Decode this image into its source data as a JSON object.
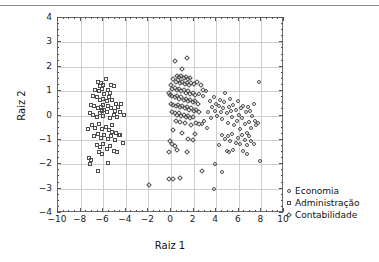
{
  "chart_data": {
    "type": "scatter",
    "title": "",
    "xlabel": "Raiz 1",
    "ylabel": "Raiz 2",
    "xlim": [
      -10,
      10
    ],
    "ylim": [
      -4,
      4
    ],
    "xticks": [
      -10,
      -8,
      -6,
      -4,
      -2,
      0,
      2,
      4,
      6,
      8,
      10
    ],
    "xticklabels": [
      "−10",
      "−8",
      "−6",
      "−4",
      "−2",
      "0",
      "2",
      "4",
      "6",
      "8",
      "10"
    ],
    "yticks": [
      -4,
      -3,
      -2,
      -1,
      0,
      1,
      2,
      3,
      4
    ],
    "yticklabels": [
      "−4",
      "−3",
      "−2",
      "−1",
      "0",
      "1",
      "2",
      "3",
      "4"
    ],
    "grid": true,
    "legend_position": "right",
    "series": [
      {
        "name": "Economia",
        "marker": "circle",
        "color": "#4c4c4c",
        "points": [
          [
            2.6,
            0.85
          ],
          [
            2.9,
            0.75
          ],
          [
            3.2,
            0.95
          ],
          [
            3.5,
            0.55
          ],
          [
            3.7,
            0.3
          ],
          [
            3.9,
            0.7
          ],
          [
            4.0,
            0.15
          ],
          [
            4.1,
            0.45
          ],
          [
            4.2,
            -0.05
          ],
          [
            4.3,
            0.35
          ],
          [
            4.4,
            0.6
          ],
          [
            4.5,
            0.1
          ],
          [
            4.6,
            -0.2
          ],
          [
            4.7,
            0.25
          ],
          [
            4.8,
            0.5
          ],
          [
            4.9,
            0.9
          ],
          [
            5.0,
            0.05
          ],
          [
            5.1,
            -0.35
          ],
          [
            5.2,
            0.3
          ],
          [
            5.3,
            0.65
          ],
          [
            5.4,
            0.15
          ],
          [
            5.5,
            -0.1
          ],
          [
            5.6,
            0.4
          ],
          [
            5.7,
            -0.45
          ],
          [
            5.8,
            0.2
          ],
          [
            5.9,
            -0.25
          ],
          [
            6.0,
            0.55
          ],
          [
            6.1,
            0.0
          ],
          [
            6.2,
            -0.6
          ],
          [
            6.3,
            0.25
          ],
          [
            6.4,
            -0.15
          ],
          [
            6.5,
            0.35
          ],
          [
            6.6,
            -0.4
          ],
          [
            6.7,
            0.1
          ],
          [
            6.8,
            -0.75
          ],
          [
            6.9,
            0.3
          ],
          [
            7.0,
            -0.3
          ],
          [
            7.1,
            0.15
          ],
          [
            7.2,
            -0.55
          ],
          [
            7.3,
            -0.05
          ],
          [
            7.4,
            0.45
          ],
          [
            7.5,
            -0.25
          ],
          [
            7.6,
            -0.45
          ],
          [
            7.8,
            -0.35
          ],
          [
            7.9,
            1.35
          ],
          [
            8.0,
            -1.9
          ],
          [
            4.6,
            -0.85
          ],
          [
            4.9,
            -1.0
          ],
          [
            5.1,
            -0.9
          ],
          [
            5.3,
            -1.1
          ],
          [
            5.5,
            -0.8
          ],
          [
            5.8,
            -1.15
          ],
          [
            6.0,
            -0.95
          ],
          [
            6.2,
            -1.2
          ],
          [
            6.4,
            -0.85
          ],
          [
            6.6,
            -1.05
          ],
          [
            6.8,
            -1.25
          ],
          [
            7.0,
            -0.9
          ],
          [
            7.2,
            -1.1
          ],
          [
            7.4,
            -1.2
          ],
          [
            5.0,
            -1.5
          ],
          [
            5.2,
            -1.55
          ],
          [
            5.6,
            -1.45
          ],
          [
            6.5,
            -1.5
          ],
          [
            6.8,
            -1.6
          ],
          [
            4.3,
            -1.25
          ],
          [
            4.0,
            -2.05
          ],
          [
            4.6,
            -2.35
          ],
          [
            3.9,
            -3.05
          ],
          [
            3.3,
            -0.55
          ],
          [
            3.0,
            -0.25
          ],
          [
            2.8,
            -0.4
          ],
          [
            3.6,
            -0.15
          ],
          [
            3.4,
            0.1
          ]
        ]
      },
      {
        "name": "Administração",
        "marker": "square",
        "color": "#4c4c4c",
        "points": [
          [
            -6.4,
            1.35
          ],
          [
            -6.1,
            1.3
          ],
          [
            -5.7,
            1.45
          ],
          [
            -5.2,
            1.2
          ],
          [
            -5.0,
            1.15
          ],
          [
            -6.6,
            1.0
          ],
          [
            -6.3,
            0.95
          ],
          [
            -6.0,
            1.05
          ],
          [
            -5.8,
            0.85
          ],
          [
            -5.5,
            1.0
          ],
          [
            -5.3,
            0.9
          ],
          [
            -6.8,
            0.75
          ],
          [
            -6.5,
            0.7
          ],
          [
            -6.2,
            0.6
          ],
          [
            -5.9,
            0.65
          ],
          [
            -5.6,
            0.55
          ],
          [
            -5.4,
            0.7
          ],
          [
            -5.1,
            0.6
          ],
          [
            -4.8,
            0.45
          ],
          [
            -4.3,
            0.45
          ],
          [
            -7.0,
            0.4
          ],
          [
            -6.7,
            0.35
          ],
          [
            -6.4,
            0.25
          ],
          [
            -6.1,
            0.3
          ],
          [
            -5.8,
            0.2
          ],
          [
            -5.5,
            0.35
          ],
          [
            -5.2,
            0.25
          ],
          [
            -4.9,
            0.15
          ],
          [
            -4.6,
            0.3
          ],
          [
            -4.1,
            0.0
          ],
          [
            -7.1,
            0.05
          ],
          [
            -6.8,
            0.0
          ],
          [
            -6.5,
            -0.1
          ],
          [
            -6.2,
            0.05
          ],
          [
            -5.9,
            -0.05
          ],
          [
            -5.6,
            0.1
          ],
          [
            -5.3,
            -0.15
          ],
          [
            -5.0,
            0.0
          ],
          [
            -4.7,
            -0.1
          ],
          [
            -4.4,
            0.1
          ],
          [
            -7.3,
            -0.6
          ],
          [
            -6.9,
            -0.45
          ],
          [
            -6.6,
            -0.55
          ],
          [
            -6.3,
            -0.4
          ],
          [
            -6.0,
            -0.6
          ],
          [
            -5.7,
            -0.5
          ],
          [
            -5.4,
            -0.65
          ],
          [
            -5.1,
            -0.45
          ],
          [
            -4.8,
            -0.75
          ],
          [
            -4.5,
            -0.85
          ],
          [
            -6.7,
            -0.9
          ],
          [
            -6.4,
            -0.8
          ],
          [
            -6.1,
            -0.95
          ],
          [
            -5.8,
            -0.85
          ],
          [
            -5.5,
            -1.0
          ],
          [
            -5.2,
            -0.9
          ],
          [
            -4.9,
            -1.05
          ],
          [
            -4.2,
            -1.15
          ],
          [
            -4.4,
            -0.85
          ],
          [
            -6.5,
            -1.25
          ],
          [
            -6.2,
            -1.35
          ],
          [
            -5.9,
            -1.2
          ],
          [
            -5.6,
            -1.4
          ],
          [
            -5.3,
            -1.3
          ],
          [
            -5.0,
            -1.5
          ],
          [
            -4.7,
            -1.55
          ],
          [
            -6.3,
            -1.55
          ],
          [
            -6.0,
            -1.6
          ],
          [
            -7.2,
            -1.8
          ],
          [
            -7.0,
            -1.85
          ],
          [
            -7.1,
            -2.05
          ],
          [
            -5.5,
            -2.0
          ],
          [
            -6.4,
            -2.3
          ],
          [
            -5.9,
            1.2
          ],
          [
            -6.2,
            1.15
          ],
          [
            -5.1,
            -0.7
          ],
          [
            -5.9,
            0.4
          ],
          [
            -6.0,
            0.15
          ]
        ]
      },
      {
        "name": "Contabilidade",
        "marker": "diamond",
        "color": "#4c4c4c",
        "points": [
          [
            0.4,
            2.2
          ],
          [
            1.5,
            2.3
          ],
          [
            1.1,
            1.85
          ],
          [
            0.6,
            1.6
          ],
          [
            0.8,
            1.55
          ],
          [
            1.0,
            1.6
          ],
          [
            1.2,
            1.5
          ],
          [
            1.4,
            1.55
          ],
          [
            1.6,
            1.45
          ],
          [
            1.8,
            1.5
          ],
          [
            0.3,
            1.45
          ],
          [
            0.5,
            1.35
          ],
          [
            0.7,
            1.4
          ],
          [
            0.9,
            1.3
          ],
          [
            1.1,
            1.35
          ],
          [
            1.3,
            1.25
          ],
          [
            1.5,
            1.3
          ],
          [
            1.7,
            1.2
          ],
          [
            1.9,
            1.3
          ],
          [
            2.1,
            1.25
          ],
          [
            2.4,
            1.35
          ],
          [
            2.7,
            1.2
          ],
          [
            0.1,
            1.2
          ],
          [
            0.2,
            1.05
          ],
          [
            0.4,
            1.1
          ],
          [
            0.6,
            1.0
          ],
          [
            0.8,
            1.05
          ],
          [
            1.0,
            0.95
          ],
          [
            1.2,
            1.0
          ],
          [
            1.4,
            0.9
          ],
          [
            1.6,
            0.95
          ],
          [
            1.8,
            0.85
          ],
          [
            2.0,
            0.9
          ],
          [
            2.2,
            0.8
          ],
          [
            -0.1,
            0.9
          ],
          [
            0.0,
            0.8
          ],
          [
            0.2,
            0.75
          ],
          [
            0.4,
            0.7
          ],
          [
            0.6,
            0.75
          ],
          [
            0.8,
            0.65
          ],
          [
            1.0,
            0.7
          ],
          [
            1.2,
            0.6
          ],
          [
            1.4,
            0.65
          ],
          [
            1.6,
            0.55
          ],
          [
            1.8,
            0.6
          ],
          [
            2.0,
            0.5
          ],
          [
            2.2,
            0.55
          ],
          [
            2.5,
            0.45
          ],
          [
            0.1,
            0.45
          ],
          [
            0.3,
            0.4
          ],
          [
            0.5,
            0.35
          ],
          [
            0.7,
            0.4
          ],
          [
            0.9,
            0.3
          ],
          [
            1.1,
            0.35
          ],
          [
            1.3,
            0.25
          ],
          [
            1.5,
            0.3
          ],
          [
            1.7,
            0.2
          ],
          [
            1.9,
            0.25
          ],
          [
            2.1,
            0.15
          ],
          [
            2.3,
            0.2
          ],
          [
            2.6,
            0.1
          ],
          [
            0.2,
            0.1
          ],
          [
            0.4,
            0.05
          ],
          [
            0.6,
            0.0
          ],
          [
            0.8,
            0.05
          ],
          [
            1.0,
            -0.05
          ],
          [
            1.2,
            0.0
          ],
          [
            1.4,
            -0.1
          ],
          [
            1.6,
            -0.05
          ],
          [
            1.8,
            -0.15
          ],
          [
            2.0,
            -0.1
          ],
          [
            0.5,
            -0.25
          ],
          [
            0.9,
            -0.3
          ],
          [
            1.3,
            -0.35
          ],
          [
            2.3,
            -0.35
          ],
          [
            2.6,
            -0.4
          ],
          [
            0.3,
            -0.65
          ],
          [
            1.1,
            -0.75
          ],
          [
            2.2,
            -0.8
          ],
          [
            1.6,
            -1.0
          ],
          [
            2.0,
            -1.05
          ],
          [
            0.0,
            -1.1
          ],
          [
            0.2,
            -1.2
          ],
          [
            0.4,
            -1.3
          ],
          [
            0.6,
            -1.45
          ],
          [
            -0.1,
            -1.55
          ],
          [
            1.5,
            -1.55
          ],
          [
            -0.1,
            -2.65
          ],
          [
            0.3,
            -2.65
          ],
          [
            0.9,
            -2.6
          ],
          [
            -1.9,
            -2.9
          ],
          [
            2.85,
            -2.3
          ],
          [
            2.9,
            1.0
          ],
          [
            1.9,
            -0.45
          ]
        ]
      }
    ]
  },
  "legend": {
    "items": [
      {
        "label": "Economia",
        "marker": "circle"
      },
      {
        "label": "Administração",
        "marker": "square"
      },
      {
        "label": "Contabilidade",
        "marker": "diamond"
      }
    ]
  },
  "colors": {
    "marker": "#4c4c4c",
    "grid": "#cfcfcf",
    "frame": "#6a6a6a",
    "text": "#111111",
    "rule": "#8d8d8d",
    "background": "#ffffff"
  }
}
